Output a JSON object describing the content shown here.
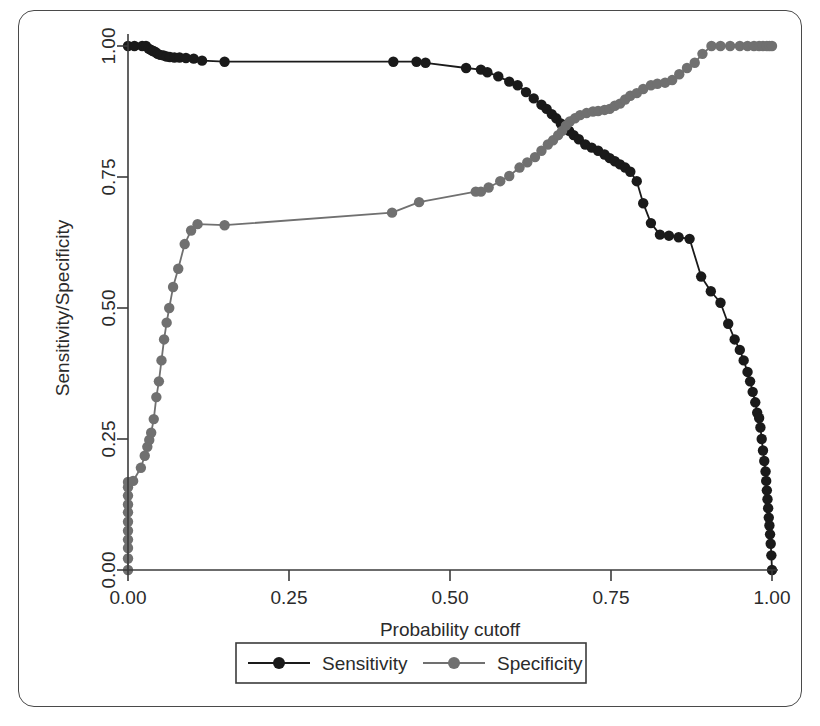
{
  "figure": {
    "kind": "line-chart",
    "background_color": "#ffffff",
    "frame_color": "#4a4a4a"
  },
  "chart_data": {
    "type": "line",
    "title": "",
    "subtitle": "",
    "xlabel": "Probability cutoff",
    "ylabel": "Sensitivity/Specificity",
    "xlim": [
      0.0,
      1.0
    ],
    "ylim": [
      0.0,
      1.0
    ],
    "xticks": [
      0.0,
      0.25,
      0.5,
      0.75,
      1.0
    ],
    "xtick_labels": [
      "0.00",
      "0.25",
      "0.50",
      "0.75",
      "1.00"
    ],
    "yticks": [
      0.0,
      0.25,
      0.5,
      0.75,
      1.0
    ],
    "ytick_labels": [
      "0.00",
      "0.25",
      "0.50",
      "0.75",
      "1.00"
    ],
    "grid": false,
    "legend_position": "bottom-center",
    "markers": "filled-circle",
    "series": [
      {
        "name": "Sensitivity",
        "color": "#1a1a1a",
        "marker_color": "#1a1a1a",
        "x": [
          0.0,
          0.01,
          0.022,
          0.028,
          0.032,
          0.035,
          0.038,
          0.04,
          0.043,
          0.046,
          0.05,
          0.055,
          0.06,
          0.065,
          0.072,
          0.08,
          0.09,
          0.102,
          0.115,
          0.15,
          0.412,
          0.448,
          0.462,
          0.525,
          0.548,
          0.558,
          0.575,
          0.592,
          0.605,
          0.618,
          0.63,
          0.642,
          0.65,
          0.658,
          0.665,
          0.672,
          0.678,
          0.685,
          0.692,
          0.7,
          0.71,
          0.72,
          0.73,
          0.74,
          0.748,
          0.756,
          0.764,
          0.772,
          0.78,
          0.79,
          0.8,
          0.812,
          0.826,
          0.84,
          0.855,
          0.872,
          0.89,
          0.905,
          0.92,
          0.932,
          0.942,
          0.95,
          0.956,
          0.962,
          0.966,
          0.97,
          0.974,
          0.977,
          0.98,
          0.982,
          0.984,
          0.986,
          0.988,
          0.99,
          0.991,
          0.992,
          0.993,
          0.994,
          0.995,
          0.996,
          0.997,
          0.998,
          0.999,
          1.0
        ],
        "y": [
          1.0,
          1.0,
          1.0,
          1.0,
          0.995,
          0.993,
          0.991,
          0.99,
          0.988,
          0.985,
          0.983,
          0.982,
          0.98,
          0.979,
          0.978,
          0.978,
          0.977,
          0.976,
          0.972,
          0.97,
          0.97,
          0.97,
          0.968,
          0.958,
          0.955,
          0.95,
          0.942,
          0.932,
          0.925,
          0.912,
          0.9,
          0.888,
          0.88,
          0.87,
          0.862,
          0.852,
          0.845,
          0.838,
          0.83,
          0.822,
          0.812,
          0.806,
          0.8,
          0.793,
          0.786,
          0.78,
          0.774,
          0.768,
          0.76,
          0.742,
          0.7,
          0.662,
          0.64,
          0.638,
          0.635,
          0.632,
          0.56,
          0.532,
          0.51,
          0.47,
          0.44,
          0.42,
          0.4,
          0.378,
          0.36,
          0.34,
          0.32,
          0.3,
          0.29,
          0.272,
          0.25,
          0.228,
          0.208,
          0.188,
          0.17,
          0.152,
          0.135,
          0.118,
          0.1,
          0.085,
          0.068,
          0.05,
          0.028,
          0.0
        ]
      },
      {
        "name": "Specificity",
        "color": "#707070",
        "marker_color": "#707070",
        "x": [
          0.0,
          0.0,
          0.0,
          0.0,
          0.0,
          0.0,
          0.0,
          0.0,
          0.0,
          0.0,
          0.0,
          0.008,
          0.02,
          0.026,
          0.03,
          0.033,
          0.036,
          0.04,
          0.044,
          0.048,
          0.052,
          0.056,
          0.06,
          0.064,
          0.07,
          0.078,
          0.088,
          0.098,
          0.108,
          0.15,
          0.41,
          0.452,
          0.54,
          0.548,
          0.56,
          0.578,
          0.592,
          0.608,
          0.62,
          0.632,
          0.642,
          0.652,
          0.66,
          0.668,
          0.674,
          0.68,
          0.686,
          0.694,
          0.702,
          0.712,
          0.722,
          0.73,
          0.74,
          0.748,
          0.756,
          0.764,
          0.772,
          0.78,
          0.79,
          0.8,
          0.812,
          0.822,
          0.834,
          0.845,
          0.856,
          0.868,
          0.88,
          0.892,
          0.906,
          0.92,
          0.935,
          0.95,
          0.962,
          0.972,
          0.98,
          0.986,
          0.992,
          0.996,
          1.0
        ],
        "y": [
          0.0,
          0.022,
          0.042,
          0.058,
          0.075,
          0.092,
          0.11,
          0.125,
          0.142,
          0.158,
          0.168,
          0.17,
          0.195,
          0.218,
          0.235,
          0.248,
          0.262,
          0.288,
          0.33,
          0.36,
          0.4,
          0.44,
          0.472,
          0.5,
          0.54,
          0.575,
          0.622,
          0.648,
          0.66,
          0.658,
          0.682,
          0.702,
          0.722,
          0.722,
          0.73,
          0.742,
          0.752,
          0.768,
          0.778,
          0.788,
          0.8,
          0.812,
          0.82,
          0.83,
          0.838,
          0.848,
          0.856,
          0.862,
          0.868,
          0.872,
          0.875,
          0.876,
          0.878,
          0.88,
          0.886,
          0.89,
          0.898,
          0.905,
          0.91,
          0.918,
          0.925,
          0.928,
          0.93,
          0.935,
          0.946,
          0.958,
          0.968,
          0.985,
          1.0,
          1.0,
          1.0,
          1.0,
          1.0,
          1.0,
          1.0,
          1.0,
          1.0,
          1.0,
          1.0
        ]
      }
    ],
    "legend": [
      {
        "label": "Sensitivity",
        "color": "#1a1a1a"
      },
      {
        "label": "Specificity",
        "color": "#707070"
      }
    ]
  }
}
